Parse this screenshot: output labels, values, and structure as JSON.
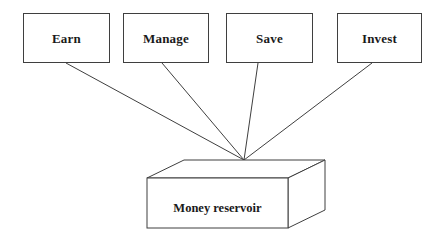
{
  "diagram": {
    "type": "flow-convergence-diagram",
    "canvas": {
      "width": 445,
      "height": 248,
      "background": "#ffffff"
    },
    "stroke_color": "#3f3f3f",
    "text_color": "#1a1a1a",
    "nodes": [
      {
        "id": "earn",
        "label": "Earn",
        "shape": "rectangle",
        "x": 23,
        "y": 13,
        "w": 87,
        "h": 50
      },
      {
        "id": "manage",
        "label": "Manage",
        "shape": "rectangle",
        "x": 123,
        "y": 13,
        "w": 86,
        "h": 50
      },
      {
        "id": "save",
        "label": "Save",
        "shape": "rectangle",
        "x": 226,
        "y": 13,
        "w": 87,
        "h": 50
      },
      {
        "id": "invest",
        "label": "Invest",
        "shape": "rectangle",
        "x": 337,
        "y": 13,
        "w": 85,
        "h": 50
      }
    ],
    "target": {
      "id": "money-reservoir",
      "label": "Money reservoir",
      "shape": "cuboid",
      "front_face": {
        "x": 147,
        "y": 178,
        "w": 141,
        "h": 50
      },
      "depth_offset": {
        "dx": 37,
        "dy": -18
      },
      "label_position": {
        "x": 210,
        "y": 208
      }
    },
    "convergence_point": {
      "x": 244,
      "y": 160
    },
    "edges": [
      {
        "from": "earn",
        "to": "money-reservoir",
        "x1": 66,
        "y1": 63,
        "x2": 244,
        "y2": 160
      },
      {
        "from": "manage",
        "to": "money-reservoir",
        "x1": 162,
        "y1": 63,
        "x2": 244,
        "y2": 160
      },
      {
        "from": "save",
        "to": "money-reservoir",
        "x1": 258,
        "y1": 63,
        "x2": 244,
        "y2": 160
      },
      {
        "from": "invest",
        "to": "money-reservoir",
        "x1": 372,
        "y1": 63,
        "x2": 244,
        "y2": 160
      }
    ]
  }
}
